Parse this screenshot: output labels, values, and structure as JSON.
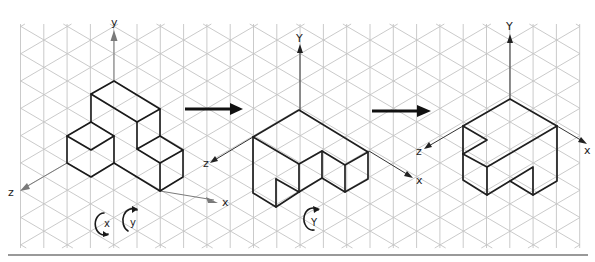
{
  "figure": {
    "colors": {
      "grid": "#c4c4c4",
      "edges": "#1a1a1a",
      "axis_first": "#7a7a7a",
      "axis_sketch": "#333333"
    }
  },
  "stage1": {
    "axis_labels": {
      "y": "y",
      "z": "z",
      "x": "x"
    },
    "rotation_labels": {
      "x": "x",
      "y": "y"
    }
  },
  "stage2": {
    "axis_labels": {
      "y": "Y",
      "z": "z",
      "x": "x"
    },
    "rotation_label": "Y"
  },
  "stage3": {
    "axis_labels": {
      "y": "Y",
      "z": "z",
      "x": "x"
    }
  },
  "arrows": [
    {
      "name": "transition-arrow-1",
      "from": "stage1",
      "to": "stage2"
    },
    {
      "name": "transition-arrow-2",
      "from": "stage2",
      "to": "stage3"
    }
  ]
}
